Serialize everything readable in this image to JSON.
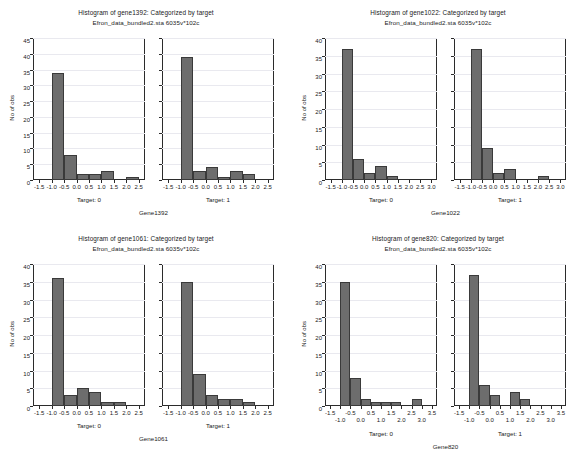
{
  "figure": {
    "subtitle_common": "Efron_data_bundled2.sta 6035v*102c",
    "ylabel": "No of obs",
    "bar_color": "#6d6d6d",
    "bar_edge_color": "#3a3a3a",
    "axis_color": "#2b2b2b",
    "gridline_color": "#e9e9ef",
    "background": "#ffffff"
  },
  "chart_data": [
    {
      "id": "gene1392",
      "type": "bar",
      "title": "Histogram of gene1392: Categorized by target",
      "subtitle": "Efron_data_bundled2.sta 6035v*102c",
      "ylabel": "No of obs",
      "xlabel": "Gene1392",
      "ylim": [
        0,
        45
      ],
      "yticks": [
        "0",
        "5",
        "10",
        "15",
        "20",
        "25",
        "30",
        "35",
        "40",
        "45"
      ],
      "xlim": [
        -1.75,
        2.75
      ],
      "xticks": [
        "-1.5",
        "-1.0",
        "-0.5",
        "0.0",
        "0.5",
        "1.0",
        "1.5",
        "2.0",
        "2.5"
      ],
      "xtick_values": [
        -1.5,
        -1.0,
        -0.5,
        0.0,
        0.5,
        1.0,
        1.5,
        2.0,
        2.5
      ],
      "xtick_stagger": false,
      "grid": true,
      "bin_width": 0.5,
      "panels": [
        {
          "label": "Target: 0",
          "bin_starts": [
            -1.0,
            -0.5,
            0.0,
            0.5,
            1.0,
            2.0
          ],
          "values": [
            34,
            8,
            2,
            2,
            3,
            1
          ]
        },
        {
          "label": "Target: 1",
          "bin_starts": [
            -1.0,
            -0.5,
            0.0,
            0.5,
            1.0,
            1.5
          ],
          "values": [
            39,
            3,
            4,
            1,
            3,
            2
          ]
        }
      ]
    },
    {
      "id": "gene1022",
      "type": "bar",
      "title": "Histogram of gene1022: Categorized by target",
      "subtitle": "Efron_data_bundled2.sta 6035v*102c",
      "ylabel": "No of obs",
      "xlabel": "Gene1022",
      "ylim": [
        0,
        40
      ],
      "yticks": [
        "0",
        "5",
        "10",
        "15",
        "20",
        "25",
        "30",
        "35",
        "40"
      ],
      "xlim": [
        -1.75,
        3.25
      ],
      "xticks": [
        "-1.5",
        "-1.0",
        "-0.5",
        "0.0",
        "0.5",
        "1.0",
        "1.5",
        "2.0",
        "2.5",
        "3.0"
      ],
      "xtick_values": [
        -1.5,
        -1.0,
        -0.5,
        0.0,
        0.5,
        1.0,
        1.5,
        2.0,
        2.5,
        3.0
      ],
      "xtick_stagger": false,
      "grid": true,
      "bin_width": 0.5,
      "panels": [
        {
          "label": "Target: 0",
          "bin_starts": [
            -1.0,
            -0.5,
            0.0,
            0.5,
            1.0
          ],
          "values": [
            37,
            6,
            2,
            4,
            1
          ]
        },
        {
          "label": "Target: 1",
          "bin_starts": [
            -1.0,
            -0.5,
            0.0,
            0.5,
            2.0
          ],
          "values": [
            37,
            9,
            2,
            3,
            1
          ]
        }
      ]
    },
    {
      "id": "gene1061",
      "type": "bar",
      "title": "Histogram of gene1061: Categorized by target",
      "subtitle": "Efron_data_bundled2.sta 6035v*102c",
      "ylabel": "No of obs",
      "xlabel": "Gene1061",
      "ylim": [
        0,
        40
      ],
      "yticks": [
        "0",
        "5",
        "10",
        "15",
        "20",
        "25",
        "30",
        "35",
        "40"
      ],
      "xlim": [
        -1.75,
        2.75
      ],
      "xticks": [
        "-1.5",
        "-1.0",
        "-0.5",
        "0.0",
        "0.5",
        "1.0",
        "1.5",
        "2.0",
        "2.5"
      ],
      "xtick_values": [
        -1.5,
        -1.0,
        -0.5,
        0.0,
        0.5,
        1.0,
        1.5,
        2.0,
        2.5
      ],
      "xtick_stagger": false,
      "grid": true,
      "bin_width": 0.5,
      "panels": [
        {
          "label": "Target: 0",
          "bin_starts": [
            -1.0,
            -0.5,
            0.0,
            0.5,
            1.0,
            1.5
          ],
          "values": [
            36,
            3,
            5,
            4,
            1,
            1
          ]
        },
        {
          "label": "Target: 1",
          "bin_starts": [
            -1.0,
            -0.5,
            0.0,
            0.5,
            1.0,
            1.5
          ],
          "values": [
            35,
            9,
            3,
            2,
            2,
            1
          ]
        }
      ]
    },
    {
      "id": "gene820",
      "type": "bar",
      "title": "Histogram of gene820: Categorized by target",
      "subtitle": "Efron_data_bundled2.sta 6035v*102c",
      "ylabel": "No of obs",
      "xlabel": "Gene820",
      "ylim": [
        0,
        40
      ],
      "yticks": [
        "0",
        "5",
        "10",
        "15",
        "20",
        "25",
        "30",
        "35",
        "40"
      ],
      "xlim": [
        -1.75,
        3.75
      ],
      "xticks": [
        "-1.5",
        "-1.0",
        "-0.5",
        "0.0",
        "0.5",
        "1.0",
        "1.5",
        "2.0",
        "2.5",
        "3.0",
        "3.5"
      ],
      "xtick_values": [
        -1.5,
        -1.0,
        -0.5,
        0.0,
        0.5,
        1.0,
        1.5,
        2.0,
        2.5,
        3.0,
        3.5
      ],
      "xtick_stagger": true,
      "grid": true,
      "bin_width": 0.5,
      "panels": [
        {
          "label": "Target: 0",
          "bin_starts": [
            -1.0,
            -0.5,
            0.0,
            0.5,
            1.0,
            1.5,
            2.5
          ],
          "values": [
            35,
            8,
            2,
            1,
            1,
            1,
            2
          ]
        },
        {
          "label": "Target: 1",
          "bin_starts": [
            -1.0,
            -0.5,
            0.0,
            1.0,
            1.5
          ],
          "values": [
            37,
            6,
            3,
            4,
            2
          ]
        }
      ]
    }
  ]
}
